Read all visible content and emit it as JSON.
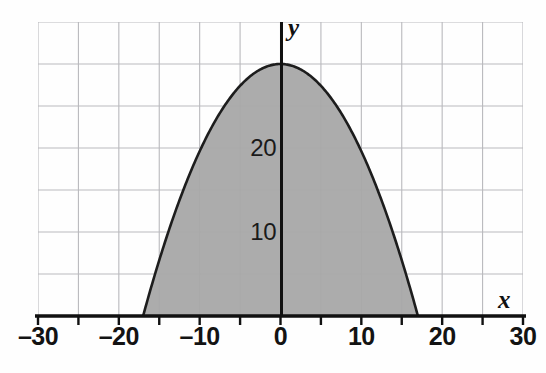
{
  "chart_data": {
    "type": "area",
    "title": "",
    "subtitle": "",
    "xlabel": "x",
    "ylabel": "y",
    "xlim": [
      -30,
      30
    ],
    "ylim": [
      0,
      33.5
    ],
    "grid": true,
    "legend": null,
    "annotations": [],
    "curve_description": "Downward-opening parabola shaded between the curve and the x-axis",
    "equation": "y = 30 - 30x^2/289",
    "vertex": [
      0,
      30
    ],
    "roots": [
      -17,
      17
    ],
    "x_tick_values": [
      -30,
      -25,
      -20,
      -15,
      -10,
      -5,
      0,
      5,
      10,
      15,
      20,
      25,
      30
    ],
    "x_tick_labels": [
      "–30",
      "",
      "–20",
      "",
      "–10",
      "",
      "0",
      "",
      "10",
      "",
      "20",
      "",
      "30"
    ],
    "x_labeled_ticks": [
      {
        "value": -30,
        "label": "–30"
      },
      {
        "value": -20,
        "label": "–20"
      },
      {
        "value": -10,
        "label": "–10"
      },
      {
        "value": 0,
        "label": "0"
      },
      {
        "value": 10,
        "label": "10"
      },
      {
        "value": 20,
        "label": "20"
      },
      {
        "value": 30,
        "label": "30"
      }
    ],
    "y_labeled_ticks": [
      {
        "value": 20,
        "label": "20"
      },
      {
        "value": 10,
        "label": "10"
      }
    ],
    "gridline_x_values": [
      -25,
      -20,
      -15,
      -10,
      -5,
      0,
      5,
      10,
      15,
      20,
      25
    ],
    "gridline_y_values": [
      5,
      10,
      15,
      20,
      25,
      30
    ],
    "series": [
      {
        "name": "parabola",
        "x": [
          -17,
          -15,
          -12.5,
          -10,
          -7.5,
          -5,
          -2.5,
          0,
          2.5,
          5,
          7.5,
          10,
          12.5,
          15,
          17
        ],
        "values": [
          0,
          6.6,
          14.2,
          19.6,
          24.2,
          27.4,
          29.4,
          30,
          29.4,
          27.4,
          24.2,
          19.6,
          14.2,
          6.6,
          0
        ]
      }
    ],
    "colors": {
      "fill": "#a8a8a8",
      "curve": "#1d1d1d",
      "axis": "#111111",
      "grid": "#b9b9bd",
      "background": "#fefefe",
      "text": "#131313"
    }
  },
  "axis_labels": {
    "x": "x",
    "y": "y"
  }
}
